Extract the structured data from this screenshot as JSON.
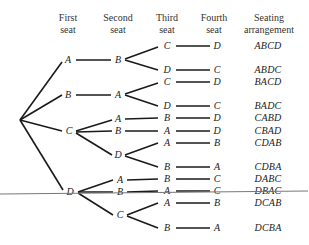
{
  "headers": {
    "first": [
      "First",
      "seat"
    ],
    "second": [
      "Second",
      "seat"
    ],
    "third": [
      "Third",
      "seat"
    ],
    "fourth": [
      "Fourth",
      "seat"
    ],
    "arrangement": [
      "Seating",
      "arrangement"
    ]
  },
  "tree": {
    "first": [
      "A",
      "B",
      "C",
      "D"
    ],
    "second": [
      "B",
      "A",
      "A",
      "B",
      "D",
      "A",
      "B",
      "C"
    ],
    "third": [
      "C",
      "D",
      "C",
      "D",
      "B",
      "A",
      "A",
      "B",
      "B",
      "A",
      "A",
      "B"
    ],
    "fourth": [
      "D",
      "C",
      "D",
      "C",
      "D",
      "D",
      "B",
      "A",
      "C",
      "C",
      "B",
      "A"
    ]
  },
  "arrangements": [
    "ABCD",
    "ABDC",
    "BACD",
    "BADC",
    "CABD",
    "CBAD",
    "CDAB",
    "CDBA",
    "DABC",
    "DBAC",
    "DCAB",
    "DCBA"
  ]
}
